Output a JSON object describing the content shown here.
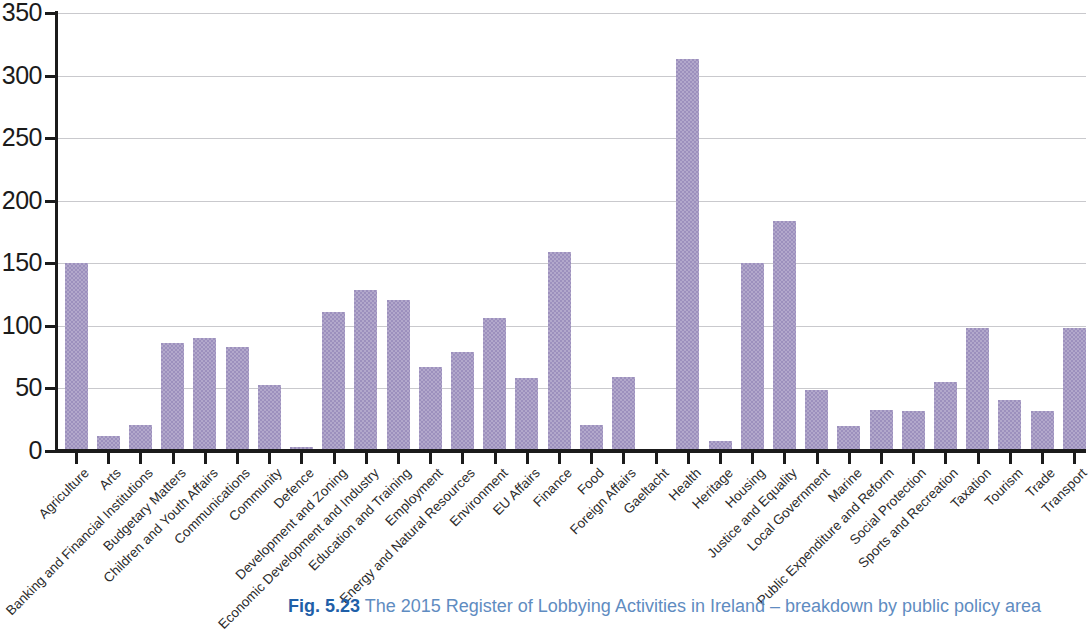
{
  "caption": {
    "figure_number": "Fig. 5.23",
    "text": " The 2015 Register of Lobbying Activities in Ireland – breakdown by public policy area"
  },
  "axes": {
    "y_ticks": [
      "0",
      "50",
      "100",
      "150",
      "200",
      "250",
      "300",
      "350"
    ],
    "ylabel": "",
    "xlabel": ""
  },
  "chart_data": {
    "type": "bar",
    "title": "The 2015 Register of Lobbying Activities in Ireland – breakdown by public policy area",
    "xlabel": "",
    "ylabel": "",
    "ylim": [
      0,
      350
    ],
    "ytick_step": 50,
    "grid": true,
    "legend": "none",
    "bar_color": "#9c90bd",
    "gridline_color": "#c9c9cd",
    "axis_color": "#1b1b1b",
    "categories": [
      "Agriculture",
      "Arts",
      "Banking and Financial Institutions",
      "Budgetary Matters",
      "Children and Youth Affairs",
      "Communications",
      "Community",
      "Defence",
      "Development and Zoning",
      "Economic Development and Industry",
      "Education and Training",
      "Employment",
      "Energy and Natural Resources",
      "Environment",
      "EU Affairs",
      "Finance",
      "Food",
      "Foreign Affairs",
      "Gaeltacht",
      "Health",
      "Heritage",
      "Housing",
      "Justice and Equality",
      "Local Government",
      "Marine",
      "Public Expenditure and Reform",
      "Social Protection",
      "Sports and Recreation",
      "Taxation",
      "Tourism",
      "Trade",
      "Transport"
    ],
    "values": [
      150,
      12,
      21,
      86,
      90,
      83,
      53,
      3,
      111,
      129,
      121,
      67,
      79,
      106,
      58,
      159,
      21,
      59,
      2,
      313,
      8,
      150,
      184,
      49,
      20,
      33,
      32,
      55,
      98,
      41,
      32,
      98
    ]
  }
}
